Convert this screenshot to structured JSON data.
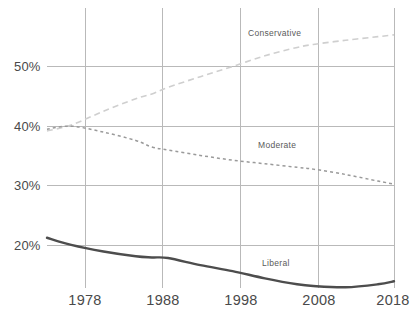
{
  "chart_data": {
    "type": "line",
    "title": "",
    "subtitle": "",
    "xlabel": "",
    "ylabel": "",
    "xlim": [
      1975,
      2018
    ],
    "ylim": [
      11,
      57
    ],
    "grid": true,
    "legend_position": "inline-labels",
    "x_ticks": [
      "1978",
      "1988",
      "1998",
      "2008",
      "2018"
    ],
    "x_tick_values": [
      1978,
      1988,
      1998,
      2008,
      2018
    ],
    "y_ticks": [
      "20%",
      "30%",
      "40%",
      "50%"
    ],
    "y_tick_values": [
      20,
      30,
      40,
      50
    ],
    "x": [
      1975,
      1978,
      1982,
      1986,
      1988,
      1990,
      1994,
      1998,
      2002,
      2006,
      2008,
      2012,
      2016,
      2018
    ],
    "series": [
      {
        "name": "Conservative",
        "label": "Conservative",
        "color": "#cfcfcf",
        "style": "dashed",
        "values": [
          39.2,
          40.2,
          42.5,
          44.6,
          45.4,
          46.5,
          48.3,
          50.0,
          51.8,
          53.2,
          53.7,
          54.4,
          55.0,
          55.3
        ]
      },
      {
        "name": "Moderate",
        "label": "Moderate",
        "color": "#9a9a9a",
        "style": "dotted",
        "values": [
          39.5,
          40.0,
          39.0,
          37.6,
          36.5,
          36.0,
          35.1,
          34.3,
          33.7,
          33.1,
          32.8,
          31.9,
          30.8,
          30.3
        ]
      },
      {
        "name": "Liberal",
        "label": "Liberal",
        "color": "#4d4d4d",
        "style": "solid",
        "values": [
          21.3,
          20.1,
          19.0,
          18.2,
          18.0,
          17.9,
          16.7,
          15.7,
          14.5,
          13.5,
          13.2,
          13.0,
          13.5,
          14.0
        ]
      }
    ],
    "annotations": [
      {
        "text": "Conservative",
        "x": 1999.5,
        "y": 56.2
      },
      {
        "text": "Moderate",
        "x": 2000.5,
        "y": 36.6
      },
      {
        "text": "Liberal",
        "x": 2001.0,
        "y": 16.8
      }
    ]
  }
}
